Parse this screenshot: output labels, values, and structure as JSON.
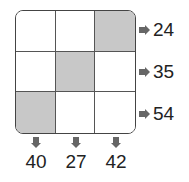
{
  "grid": {
    "rows": 3,
    "cols": 3,
    "cells": [
      {
        "shaded": false
      },
      {
        "shaded": false
      },
      {
        "shaded": true
      },
      {
        "shaded": false
      },
      {
        "shaded": true
      },
      {
        "shaded": false
      },
      {
        "shaded": true
      },
      {
        "shaded": false
      },
      {
        "shaded": false
      }
    ],
    "shade_color": "#c8c8c8"
  },
  "row_sums": [
    "24",
    "35",
    "54"
  ],
  "col_sums": [
    "40",
    "27",
    "42"
  ]
}
